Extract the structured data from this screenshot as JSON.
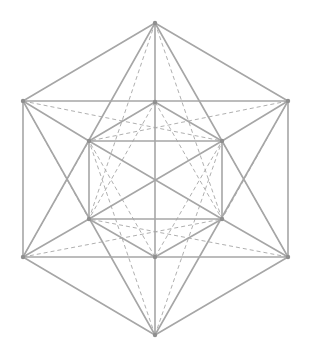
{
  "diagram": {
    "title": "",
    "type": "polyhedron-projection",
    "colors": {
      "background": "#ffffff",
      "solid_edge": "#a6a6a6",
      "dashed_edge": "#b0b0b0",
      "vertex": "#8f8f8f"
    },
    "vertices": {
      "T": [
        155,
        23
      ],
      "B": [
        155,
        335
      ],
      "OL1": [
        23,
        101
      ],
      "OR1": [
        288,
        101
      ],
      "OL2": [
        23,
        257
      ],
      "OR2": [
        288,
        257
      ],
      "IT": [
        155,
        102
      ],
      "IB": [
        155,
        257
      ],
      "IL1": [
        89,
        141
      ],
      "IR1": [
        222,
        141
      ],
      "IL2": [
        89,
        219
      ],
      "IR2": [
        222,
        219
      ]
    },
    "solid_edges": [
      [
        "T",
        "OL1"
      ],
      [
        "T",
        "OR1"
      ],
      [
        "B",
        "OL2"
      ],
      [
        "B",
        "OR2"
      ],
      [
        "OL1",
        "OL2"
      ],
      [
        "OR1",
        "OR2"
      ],
      [
        "OL1",
        "OR1"
      ],
      [
        "OL2",
        "OR2"
      ],
      [
        "T",
        "IT"
      ],
      [
        "IT",
        "IB"
      ],
      [
        "IB",
        "B"
      ],
      [
        "T",
        "OL2"
      ],
      [
        "T",
        "OR2"
      ],
      [
        "B",
        "OL1"
      ],
      [
        "B",
        "OR1"
      ],
      [
        "IT",
        "IL1"
      ],
      [
        "IT",
        "IR1"
      ],
      [
        "IB",
        "IL2"
      ],
      [
        "IB",
        "IR2"
      ],
      [
        "IL1",
        "IR1"
      ],
      [
        "IL2",
        "IR2"
      ],
      [
        "IL1",
        "IL2"
      ],
      [
        "IR1",
        "IR2"
      ],
      [
        "IL1",
        "IR2"
      ],
      [
        "IR1",
        "IL2"
      ],
      [
        "OL1",
        "IL1"
      ],
      [
        "OR1",
        "IR1"
      ],
      [
        "OL2",
        "IL2"
      ],
      [
        "OR2",
        "IR2"
      ]
    ],
    "dashed_edges": [
      [
        "OL1",
        "IR1"
      ],
      [
        "OR1",
        "IL1"
      ],
      [
        "OL2",
        "IR2"
      ],
      [
        "OR2",
        "IL2"
      ],
      [
        "OL1",
        "IL2"
      ],
      [
        "OR1",
        "IR2"
      ],
      [
        "OL2",
        "IL1"
      ],
      [
        "OR2",
        "IR1"
      ],
      [
        "T",
        "IL2"
      ],
      [
        "T",
        "IR2"
      ],
      [
        "B",
        "IL1"
      ],
      [
        "B",
        "IR1"
      ],
      [
        "IT",
        "IL2"
      ],
      [
        "IT",
        "IR2"
      ],
      [
        "IB",
        "IL1"
      ],
      [
        "IB",
        "IR1"
      ]
    ]
  }
}
